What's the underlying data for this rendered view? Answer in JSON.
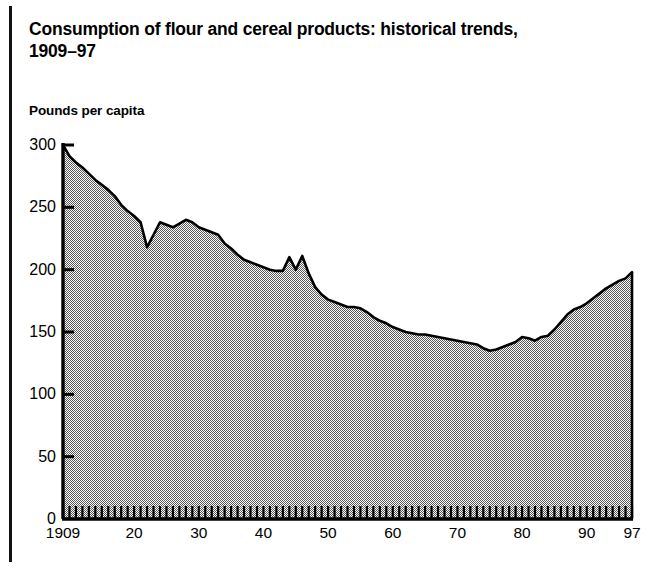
{
  "figure": {
    "title": "Consumption of flour and cereal products: historical trends,\n1909–97",
    "y_axis_label": "Pounds per capita"
  },
  "style": {
    "fill_color": "#a8a8a8",
    "line_color": "#000000",
    "axis_color": "#000000",
    "background": "#ffffff"
  },
  "chart_data": {
    "type": "area",
    "title": "Consumption of flour and cereal products: historical trends, 1909–97",
    "xlabel": "",
    "ylabel": "Pounds per capita",
    "xlim": [
      1909,
      1997
    ],
    "ylim": [
      0,
      300
    ],
    "grid": false,
    "legend": null,
    "y_ticks": [
      0,
      50,
      100,
      150,
      200,
      250,
      300
    ],
    "y_tick_labels": [
      "0",
      "50",
      "100",
      "150",
      "200",
      "250",
      "300"
    ],
    "x_ticks": [
      1909,
      1920,
      1930,
      1940,
      1950,
      1960,
      1970,
      1980,
      1990,
      1997
    ],
    "x_tick_labels": [
      "1909",
      "20",
      "30",
      "40",
      "50",
      "60",
      "70",
      "80",
      "90",
      "97"
    ],
    "minor_x_ticks_every_year": true,
    "x": [
      1909,
      1910,
      1911,
      1912,
      1913,
      1914,
      1915,
      1916,
      1917,
      1918,
      1919,
      1920,
      1921,
      1922,
      1923,
      1924,
      1925,
      1926,
      1927,
      1928,
      1929,
      1930,
      1931,
      1932,
      1933,
      1934,
      1935,
      1936,
      1937,
      1938,
      1939,
      1940,
      1941,
      1942,
      1943,
      1944,
      1945,
      1946,
      1947,
      1948,
      1949,
      1950,
      1951,
      1952,
      1953,
      1954,
      1955,
      1956,
      1957,
      1958,
      1959,
      1960,
      1961,
      1962,
      1963,
      1964,
      1965,
      1966,
      1967,
      1968,
      1969,
      1970,
      1971,
      1972,
      1973,
      1974,
      1975,
      1976,
      1977,
      1978,
      1979,
      1980,
      1981,
      1982,
      1983,
      1984,
      1985,
      1986,
      1987,
      1988,
      1989,
      1990,
      1991,
      1992,
      1993,
      1994,
      1995,
      1996,
      1997
    ],
    "values": [
      300,
      291,
      286,
      282,
      277,
      272,
      268,
      264,
      259,
      252,
      247,
      243,
      238,
      218,
      228,
      238,
      236,
      234,
      237,
      240,
      238,
      234,
      232,
      230,
      228,
      221,
      217,
      212,
      208,
      206,
      204,
      202,
      200,
      199,
      199,
      210,
      200,
      211,
      197,
      186,
      180,
      176,
      174,
      172,
      170,
      170,
      169,
      166,
      162,
      159,
      157,
      154,
      152,
      150,
      149,
      148,
      148,
      147,
      146,
      145,
      144,
      143,
      142,
      141,
      140,
      137,
      135,
      136,
      138,
      140,
      142,
      146,
      145,
      143,
      146,
      147,
      152,
      158,
      164,
      168,
      170,
      173,
      177,
      181,
      185,
      188,
      191,
      193,
      198
    ]
  }
}
